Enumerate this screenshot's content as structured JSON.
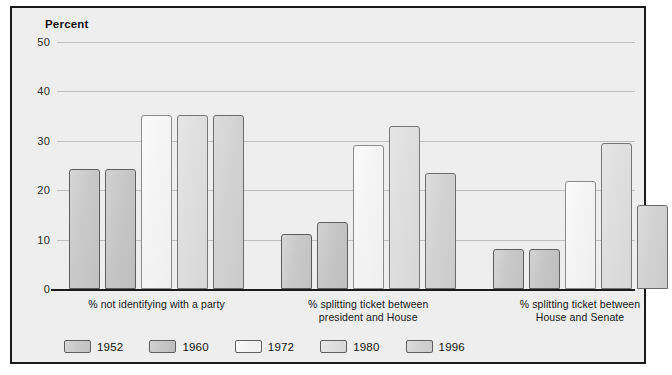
{
  "chart_data": {
    "type": "bar",
    "title": "",
    "ylabel": "Percent",
    "xlabel": "",
    "ylim": [
      0,
      50
    ],
    "yticks": [
      0,
      10,
      20,
      30,
      40,
      50
    ],
    "grid": true,
    "legend_position": "bottom-left",
    "categories": [
      "% not identifying with a party",
      "% splitting ticket between\npresident and House",
      "% splitting ticket between\nHouse and Senate"
    ],
    "category_lines": [
      [
        "% not identifying with a party"
      ],
      [
        "% splitting ticket between",
        "president and House"
      ],
      [
        "% splitting ticket between",
        "House and Senate"
      ]
    ],
    "series": [
      {
        "name": "1952",
        "color": "#c9c9c9",
        "values": [
          24.3,
          11.2,
          8.2
        ]
      },
      {
        "name": "1960",
        "color": "#c6c6c6",
        "values": [
          24.3,
          13.5,
          8.1
        ]
      },
      {
        "name": "1972",
        "color": "#f6f6f6",
        "values": [
          35.2,
          29.1,
          21.8
        ]
      },
      {
        "name": "1980",
        "color": "#dedede",
        "values": [
          35.2,
          33.0,
          29.6
        ]
      },
      {
        "name": "1996",
        "color": "#d2d2d2",
        "values": [
          35.2,
          23.4,
          17.1
        ]
      }
    ]
  }
}
